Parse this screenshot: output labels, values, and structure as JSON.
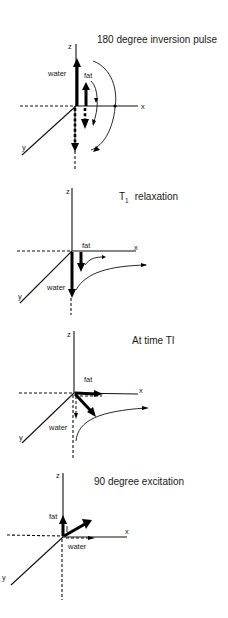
{
  "figure": {
    "panels": [
      {
        "title": "180 degree inversion pulse",
        "axes": {
          "z": "z",
          "x": "x",
          "y": "y"
        },
        "labels": {
          "water": "water",
          "fat": "fat"
        }
      },
      {
        "title_main": "T",
        "title_sub": "1",
        "title_rest": "relaxation",
        "axes": {
          "z": "z",
          "x": "x",
          "y": "y"
        },
        "labels": {
          "water": "water",
          "fat": "fat"
        }
      },
      {
        "title": "At time TI",
        "axes": {
          "z": "z",
          "x": "x",
          "y": "y"
        },
        "labels": {
          "water": "water",
          "fat": "fat"
        }
      },
      {
        "title": "90 degree excitation",
        "axes": {
          "z": "z",
          "x": "x",
          "y": "y"
        },
        "labels": {
          "water": "water",
          "fat": "fat"
        }
      }
    ]
  }
}
